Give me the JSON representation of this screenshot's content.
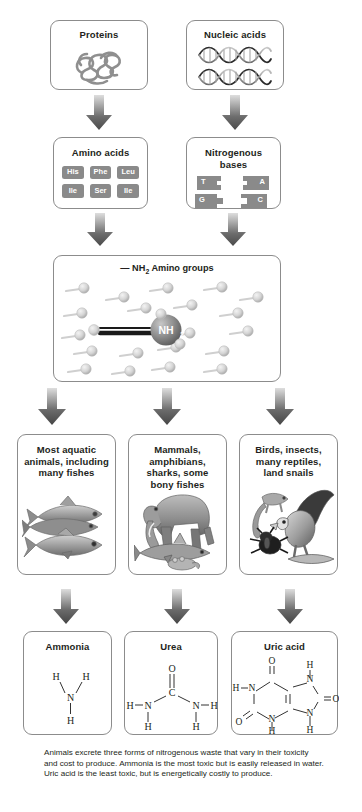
{
  "diagram": {
    "sources": [
      {
        "id": "proteins",
        "label": "Proteins",
        "icon": "tangled-polypeptide-icon"
      },
      {
        "id": "nucleic-acids",
        "label": "Nucleic acids",
        "icon": "dna-double-helix-icon"
      }
    ],
    "monomers": [
      {
        "id": "amino-acids",
        "label": "Amino acids",
        "chips": [
          "His",
          "Phe",
          "Leu",
          "Ile",
          "Ser",
          "Ile"
        ]
      },
      {
        "id": "nitrogenous-bases",
        "label": "Nitrogenous bases",
        "bases": [
          "T",
          "A",
          "G",
          "C"
        ]
      }
    ],
    "amino_group_panel": {
      "id": "amino-groups",
      "prefix": "—",
      "formula": "NH",
      "subscript": "2",
      "label": "Amino groups",
      "highlight_molecule": "NH",
      "highlight_subscript": "2",
      "molecule_count": 22
    },
    "animal_groups": [
      {
        "id": "aquatic",
        "label": "Most aquatic animals, including many fishes",
        "image": "fishes-photo"
      },
      {
        "id": "mammals",
        "label": "Mammals, amphibians, sharks, some bony fishes",
        "image": "elephant-shark-frog-photo"
      },
      {
        "id": "birds",
        "label": "Birds, insects, many reptiles, land snails",
        "image": "eagle-lizard-beetle-photo"
      }
    ],
    "wastes": [
      {
        "id": "ammonia",
        "label": "Ammonia",
        "structure": "NH3-structure"
      },
      {
        "id": "urea",
        "label": "Urea",
        "structure": "urea-structure"
      },
      {
        "id": "uric-acid",
        "label": "Uric acid",
        "structure": "uric-acid-purine-structure"
      }
    ],
    "caption": "Animals excrete three forms of nitrogenous waste that vary in their toxicity and cost to produce. Ammonia is the most toxic but is easily released in water. Uric acid is the least toxic, but is energetically costly to produce."
  },
  "colors": {
    "box_border": "#8c8c8c",
    "chip_fill": "#8a8a8a",
    "arrow_dark": "#4d4d4d",
    "arrow_light": "#d8d8d8",
    "text": "#231f20",
    "molecule_ball": "#d6d6d6",
    "nh2_ball": "#8f8f8f",
    "background": "#ffffff"
  }
}
